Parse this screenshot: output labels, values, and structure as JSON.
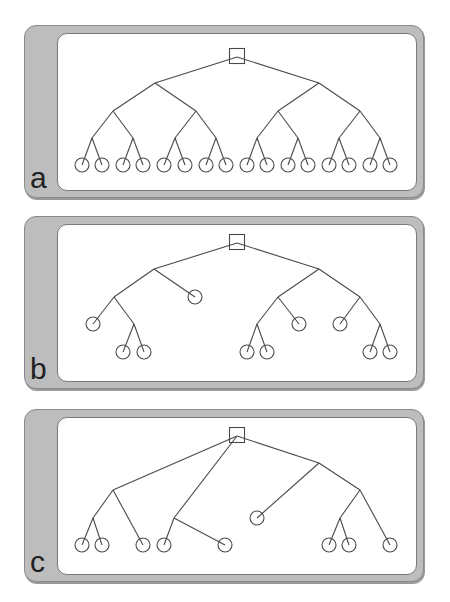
{
  "panels": [
    {
      "label": "a",
      "top": 25,
      "root": [
        236,
        55
      ],
      "edges": [
        [
          236,
          56,
          154,
          82
        ],
        [
          236,
          56,
          318,
          82
        ],
        [
          154,
          82,
          112,
          110
        ],
        [
          154,
          82,
          195,
          110
        ],
        [
          318,
          82,
          277,
          110
        ],
        [
          318,
          82,
          359,
          110
        ],
        [
          112,
          110,
          91,
          137
        ],
        [
          112,
          110,
          132,
          137
        ],
        [
          195,
          110,
          174,
          137
        ],
        [
          195,
          110,
          215,
          137
        ],
        [
          277,
          110,
          256,
          137
        ],
        [
          277,
          110,
          297,
          137
        ],
        [
          359,
          110,
          338,
          137
        ],
        [
          359,
          110,
          379,
          137
        ],
        [
          91,
          137,
          81,
          164
        ],
        [
          91,
          137,
          101,
          164
        ],
        [
          132,
          137,
          122,
          164
        ],
        [
          132,
          137,
          142,
          164
        ],
        [
          174,
          137,
          163,
          164
        ],
        [
          174,
          137,
          184,
          164
        ],
        [
          215,
          137,
          205,
          164
        ],
        [
          215,
          137,
          225,
          164
        ],
        [
          256,
          137,
          246,
          164
        ],
        [
          256,
          137,
          266,
          164
        ],
        [
          297,
          137,
          287,
          164
        ],
        [
          297,
          137,
          307,
          164
        ],
        [
          338,
          137,
          328,
          164
        ],
        [
          338,
          137,
          348,
          164
        ],
        [
          379,
          137,
          369,
          164
        ],
        [
          379,
          137,
          389,
          164
        ]
      ],
      "leaves": [
        [
          81,
          164
        ],
        [
          101,
          164
        ],
        [
          122,
          164
        ],
        [
          142,
          164
        ],
        [
          163,
          164
        ],
        [
          184,
          164
        ],
        [
          205,
          164
        ],
        [
          225,
          164
        ],
        [
          246,
          164
        ],
        [
          266,
          164
        ],
        [
          287,
          164
        ],
        [
          307,
          164
        ],
        [
          328,
          164
        ],
        [
          348,
          164
        ],
        [
          369,
          164
        ],
        [
          389,
          164
        ]
      ]
    },
    {
      "label": "b",
      "top": 216,
      "root": [
        236,
        241
      ],
      "edges": [
        [
          236,
          242,
          153,
          268
        ],
        [
          236,
          242,
          318,
          268
        ],
        [
          153,
          268,
          113,
          296
        ],
        [
          153,
          268,
          194,
          296
        ],
        [
          113,
          296,
          92,
          323
        ],
        [
          113,
          296,
          133,
          323
        ],
        [
          133,
          323,
          122,
          351
        ],
        [
          133,
          323,
          143,
          351
        ],
        [
          318,
          268,
          277,
          296
        ],
        [
          318,
          268,
          359,
          296
        ],
        [
          277,
          296,
          256,
          323
        ],
        [
          277,
          296,
          298,
          323
        ],
        [
          256,
          323,
          246,
          351
        ],
        [
          256,
          323,
          266,
          351
        ],
        [
          359,
          296,
          339,
          323
        ],
        [
          359,
          296,
          379,
          323
        ],
        [
          379,
          323,
          369,
          351
        ],
        [
          379,
          323,
          389,
          351
        ]
      ],
      "leaves": [
        [
          194,
          296
        ],
        [
          92,
          323
        ],
        [
          122,
          351
        ],
        [
          143,
          351
        ],
        [
          298,
          323
        ],
        [
          246,
          351
        ],
        [
          266,
          351
        ],
        [
          339,
          323
        ],
        [
          369,
          351
        ],
        [
          389,
          351
        ]
      ]
    },
    {
      "label": "c",
      "top": 409,
      "root": [
        236,
        434
      ],
      "edges": [
        [
          236,
          435,
          112,
          489
        ],
        [
          236,
          435,
          173,
          517
        ],
        [
          236,
          435,
          318,
          462
        ],
        [
          112,
          489,
          92,
          517
        ],
        [
          112,
          489,
          142,
          544
        ],
        [
          92,
          517,
          81,
          544
        ],
        [
          92,
          517,
          101,
          544
        ],
        [
          173,
          517,
          163,
          544
        ],
        [
          173,
          517,
          224,
          544
        ],
        [
          318,
          462,
          256,
          517
        ],
        [
          318,
          462,
          359,
          489
        ],
        [
          359,
          489,
          339,
          517
        ],
        [
          359,
          489,
          389,
          544
        ],
        [
          339,
          517,
          328,
          544
        ],
        [
          339,
          517,
          348,
          544
        ]
      ],
      "leaves": [
        [
          81,
          544
        ],
        [
          101,
          544
        ],
        [
          142,
          544
        ],
        [
          163,
          544
        ],
        [
          224,
          544
        ],
        [
          256,
          517
        ],
        [
          328,
          544
        ],
        [
          348,
          544
        ],
        [
          389,
          544
        ]
      ]
    }
  ],
  "style": {
    "line_color": "#4a4a4a",
    "panel_color": "#bdbdbd",
    "leaf_radius": 7,
    "root_size": 15
  }
}
